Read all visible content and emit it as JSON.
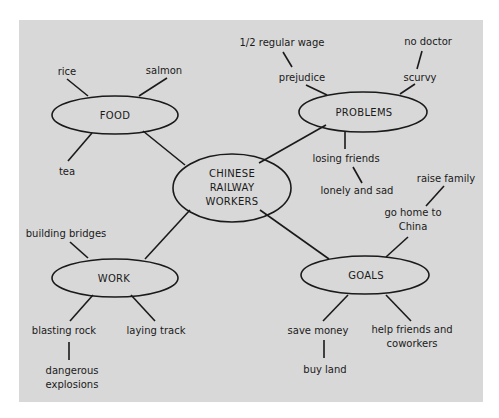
{
  "diagram": {
    "type": "concept-map",
    "center": {
      "label_lines": [
        "CHINESE",
        "RAILWAY",
        "WORKERS"
      ]
    },
    "nodes": {
      "food": {
        "label": "FOOD",
        "details": [
          "rice",
          "salmon",
          "tea"
        ]
      },
      "problems": {
        "label": "PROBLEMS",
        "details": {
          "prejudice": "prejudice",
          "half_wage": "1/2 regular wage",
          "scurvy": "scurvy",
          "no_doctor": "no doctor",
          "losing_friends": "losing friends",
          "lonely": "lonely and sad"
        }
      },
      "work": {
        "label": "WORK",
        "details": {
          "bridges": "building bridges",
          "blasting": "blasting rock",
          "explosions_1": "dangerous",
          "explosions_2": "explosions",
          "track": "laying track"
        }
      },
      "goals": {
        "label": "GOALS",
        "details": {
          "home_1": "go home to",
          "home_2": "China",
          "family": "raise family",
          "money": "save money",
          "land": "buy land",
          "help_1": "help friends and",
          "help_2": "coworkers"
        }
      }
    },
    "colors": {
      "background": "#d8d8d8",
      "ink": "#1a1a1a",
      "page": "#ffffff"
    }
  }
}
